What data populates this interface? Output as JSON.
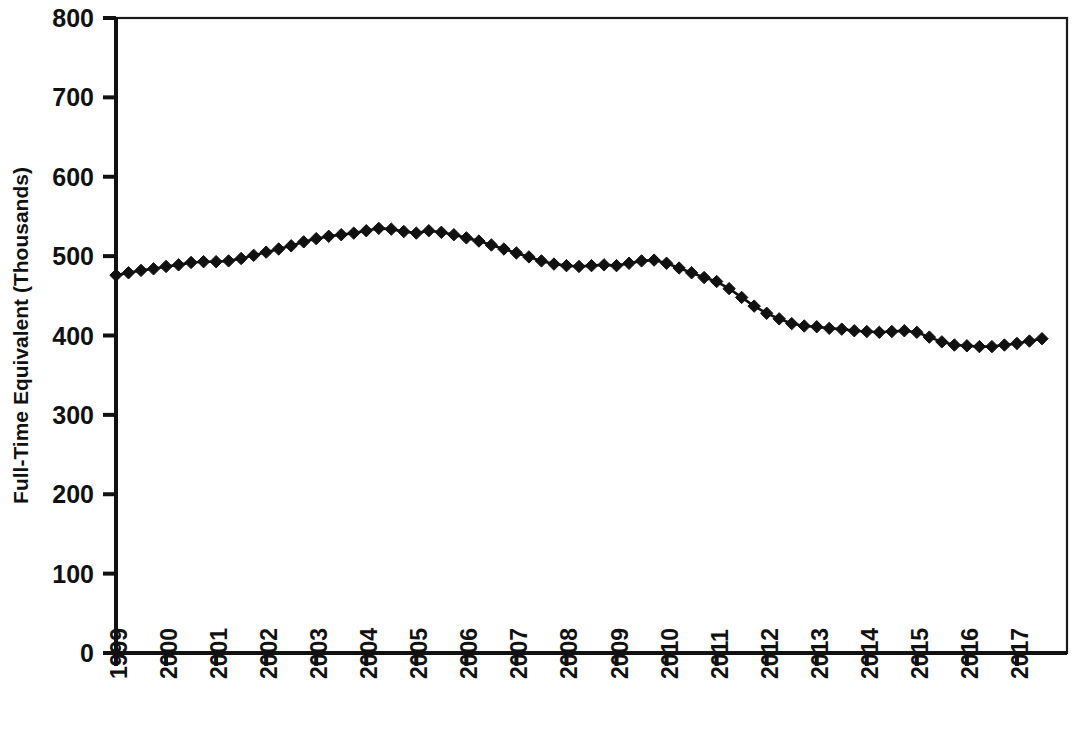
{
  "chart_data": {
    "type": "line",
    "title": "",
    "xlabel": "",
    "ylabel": "Full-Time Equivalent (Thousands)",
    "ylim": [
      0,
      800
    ],
    "ytick_labels": [
      "0",
      "100",
      "200",
      "300",
      "400",
      "500",
      "600",
      "700",
      "800"
    ],
    "ytick_values": [
      0,
      100,
      200,
      300,
      400,
      500,
      600,
      700,
      800
    ],
    "xtick_labels": [
      "1999",
      "2000",
      "2001",
      "2002",
      "2003",
      "2004",
      "2005",
      "2006",
      "2007",
      "2008",
      "2009",
      "2010",
      "2011",
      "2012",
      "2013",
      "2014",
      "2015",
      "2016",
      "2017"
    ],
    "xtick_values": [
      1999,
      2000,
      2001,
      2002,
      2003,
      2004,
      2005,
      2006,
      2007,
      2008,
      2009,
      2010,
      2011,
      2012,
      2013,
      2014,
      2015,
      2016,
      2017
    ],
    "grid": false,
    "legend": false,
    "marker": "diamond",
    "line_color": "#111111",
    "marker_color": "#111111",
    "frequency": "quarterly",
    "x": [
      1999.0,
      1999.25,
      1999.5,
      1999.75,
      2000.0,
      2000.25,
      2000.5,
      2000.75,
      2001.0,
      2001.25,
      2001.5,
      2001.75,
      2002.0,
      2002.25,
      2002.5,
      2002.75,
      2003.0,
      2003.25,
      2003.5,
      2003.75,
      2004.0,
      2004.25,
      2004.5,
      2004.75,
      2005.0,
      2005.25,
      2005.5,
      2005.75,
      2006.0,
      2006.25,
      2006.5,
      2006.75,
      2007.0,
      2007.25,
      2007.5,
      2007.75,
      2008.0,
      2008.25,
      2008.5,
      2008.75,
      2009.0,
      2009.25,
      2009.5,
      2009.75,
      2010.0,
      2010.25,
      2010.5,
      2010.75,
      2011.0,
      2011.25,
      2011.5,
      2011.75,
      2012.0,
      2012.25,
      2012.5,
      2012.75,
      2013.0,
      2013.25,
      2013.5,
      2013.75,
      2014.0,
      2014.25,
      2014.5,
      2014.75,
      2015.0,
      2015.25,
      2015.5,
      2015.75,
      2016.0,
      2016.25,
      2016.5,
      2016.75,
      2017.0,
      2017.25,
      2017.5
    ],
    "values": [
      476,
      479,
      482,
      484,
      487,
      489,
      492,
      493,
      493,
      494,
      497,
      501,
      505,
      509,
      513,
      518,
      522,
      525,
      527,
      529,
      532,
      535,
      534,
      531,
      529,
      532,
      530,
      527,
      523,
      519,
      514,
      509,
      504,
      499,
      494,
      490,
      488,
      487,
      488,
      489,
      488,
      491,
      494,
      495,
      491,
      485,
      479,
      473,
      468,
      459,
      448,
      437,
      428,
      421,
      415,
      412,
      411,
      409,
      408,
      406,
      405,
      404,
      405,
      406,
      404,
      398,
      392,
      388,
      387,
      386,
      386,
      388,
      390,
      393,
      396
    ],
    "series": [
      {
        "name": "Full-Time Equivalent",
        "values": [
          476,
          479,
          482,
          484,
          487,
          489,
          492,
          493,
          493,
          494,
          497,
          501,
          505,
          509,
          513,
          518,
          522,
          525,
          527,
          529,
          532,
          535,
          534,
          531,
          529,
          532,
          530,
          527,
          523,
          519,
          514,
          509,
          504,
          499,
          494,
          490,
          488,
          487,
          488,
          489,
          488,
          491,
          494,
          495,
          491,
          485,
          479,
          473,
          468,
          459,
          448,
          437,
          428,
          421,
          415,
          412,
          411,
          409,
          408,
          406,
          405,
          404,
          405,
          406,
          404,
          398,
          392,
          388,
          387,
          386,
          386,
          388,
          390,
          393,
          396
        ]
      }
    ]
  }
}
